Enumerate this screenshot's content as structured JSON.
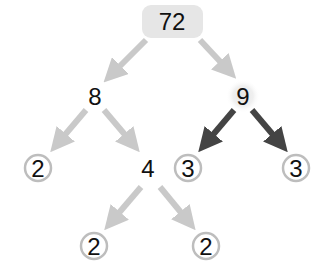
{
  "diagram": {
    "type": "factor-tree",
    "root": "72",
    "nodes": [
      {
        "id": "n72",
        "value": "72",
        "style": "rounded-box",
        "x": 172,
        "y": 21
      },
      {
        "id": "n8",
        "value": "8",
        "style": "plain",
        "x": 95,
        "y": 96
      },
      {
        "id": "n9",
        "value": "9",
        "style": "glow",
        "x": 243,
        "y": 96
      },
      {
        "id": "n2a",
        "value": "2",
        "style": "circled",
        "x": 38,
        "y": 168
      },
      {
        "id": "n4",
        "value": "4",
        "style": "plain",
        "x": 148,
        "y": 168
      },
      {
        "id": "n3a",
        "value": "3",
        "style": "circled",
        "x": 188,
        "y": 168
      },
      {
        "id": "n3b",
        "value": "3",
        "style": "circled",
        "x": 296,
        "y": 168
      },
      {
        "id": "n2b",
        "value": "2",
        "style": "circled",
        "x": 94,
        "y": 246
      },
      {
        "id": "n2c",
        "value": "2",
        "style": "circled",
        "x": 206,
        "y": 246
      }
    ],
    "edges": [
      {
        "from": "72",
        "to": "8",
        "style": "light"
      },
      {
        "from": "72",
        "to": "9",
        "style": "light"
      },
      {
        "from": "8",
        "to": "2",
        "style": "light"
      },
      {
        "from": "8",
        "to": "4",
        "style": "light"
      },
      {
        "from": "9",
        "to": "3",
        "style": "dark"
      },
      {
        "from": "9",
        "to": "3",
        "style": "dark"
      },
      {
        "from": "4",
        "to": "2",
        "style": "light"
      },
      {
        "from": "4",
        "to": "2",
        "style": "light"
      }
    ],
    "colors": {
      "light_arrow": "#c9c9c9",
      "dark_arrow": "#444444",
      "circle_stroke": "#bdbdbd",
      "root_box": "#e6e6e6",
      "glow": "#e8e8e8",
      "text": "#111111"
    }
  }
}
